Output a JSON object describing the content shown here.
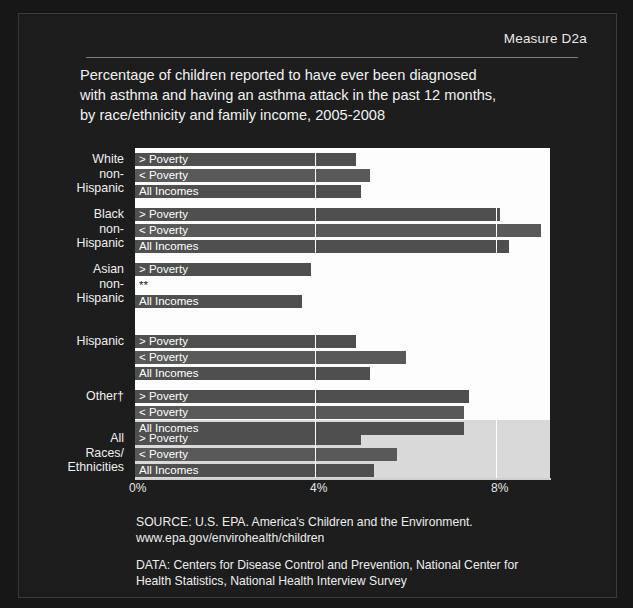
{
  "measure_label": "Measure D2a",
  "title_lines": [
    "Percentage of children reported to have ever been diagnosed",
    "with asthma and having an asthma attack in the past 12 months,",
    "by race/ethnicity and family income, 2005-2008"
  ],
  "series_labels": {
    "above": "> Poverty",
    "below": "< Poverty",
    "all": "All Incomes",
    "suppressed": "**"
  },
  "axis": {
    "ticks": [
      "0%",
      "4%",
      "8%"
    ],
    "tick_values": [
      0,
      4,
      8
    ],
    "min": 0,
    "max": 9.2
  },
  "source": {
    "line1": "SOURCE: U.S. EPA. America's Children and the Environment.",
    "line2": "www.epa.gov/envirohealth/children",
    "line3": "DATA: Centers for Disease Control and Prevention, National Center for",
    "line4": "Health Statistics, National Health Interview Survey"
  },
  "colors": {
    "panel_background": "#1d1d1d",
    "plot_background": "#fdfdfd",
    "bar": "#4f4f4f",
    "bar_alt": "#595959",
    "highlight_band": "#d9d9d9",
    "text": "#f2f2f2"
  },
  "chart_data": {
    "type": "bar",
    "orientation": "horizontal",
    "title": "Percentage of children reported to have ever been diagnosed with asthma and having an asthma attack in the past 12 months, by race/ethnicity and family income, 2005-2008",
    "xlabel": "",
    "ylabel": "",
    "xlim": [
      0,
      9.2
    ],
    "xticks": [
      0,
      4,
      8
    ],
    "xticklabels": [
      "0%",
      "4%",
      "8%"
    ],
    "grid": true,
    "legend": "none",
    "categories": [
      "White non-Hispanic",
      "Black non-Hispanic",
      "Asian non-Hispanic",
      "Hispanic",
      "Other†",
      "All Races/Ethnicities"
    ],
    "series": [
      {
        "name": "> Poverty",
        "values": [
          4.9,
          8.1,
          3.9,
          4.9,
          7.4,
          5.0
        ]
      },
      {
        "name": "< Poverty",
        "values": [
          5.2,
          9.0,
          null,
          6.0,
          7.3,
          5.8
        ]
      },
      {
        "name": "All Incomes",
        "values": [
          5.0,
          8.3,
          3.7,
          5.2,
          7.3,
          5.3
        ]
      }
    ],
    "suppressed_note": "** Asian non-Hispanic, < Poverty estimate suppressed",
    "annotations": [
      "† Other includes American Indian/Alaska Native and children of more than one race"
    ]
  },
  "category_label_lines": [
    [
      "White",
      "non-",
      "Hispanic"
    ],
    [
      "Black",
      "non-",
      "Hispanic"
    ],
    [
      "Asian",
      "non-",
      "Hispanic"
    ],
    [
      "Hispanic"
    ],
    [
      "Other†"
    ],
    [
      "All",
      "Races/",
      "Ethnicities"
    ]
  ]
}
